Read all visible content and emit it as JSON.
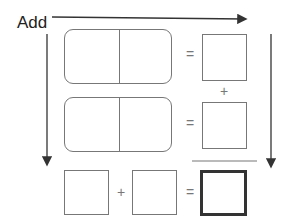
{
  "title": "Add",
  "operators": {
    "row1_equals": "=",
    "row2_equals": "=",
    "between_results_plus": "+",
    "bottom_plus": "+",
    "bottom_equals": "="
  },
  "dominoes": [
    {
      "left": "",
      "right": ""
    },
    {
      "left": "",
      "right": ""
    }
  ],
  "result_boxes": [
    "",
    ""
  ],
  "bottom_row": {
    "addend_a": "",
    "addend_b": "",
    "sum": ""
  },
  "colors": {
    "line": "#777777",
    "arrow": "#333333",
    "sum_border": "#333333"
  }
}
